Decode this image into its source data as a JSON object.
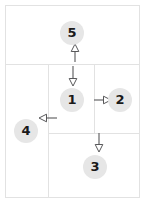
{
  "diagram": {
    "type": "region-flow-diagram",
    "canvas": {
      "width": 145,
      "height": 203
    },
    "colors": {
      "background": "#ffffff",
      "border": "#e2e2e2",
      "node_fill": "#e6e6e6",
      "node_text": "#1a1a1a",
      "arrow": "#58585a",
      "arrow_head_fill": "#ffffff"
    },
    "frame": {
      "x": 5,
      "y": 5,
      "width": 135,
      "height": 193
    },
    "regions": [
      {
        "id": "region-top",
        "label": "5",
        "x": 5,
        "y": 5,
        "width": 135,
        "height": 60
      },
      {
        "id": "region-left",
        "label": "4",
        "x": 5,
        "y": 64,
        "width": 44,
        "height": 134
      },
      {
        "id": "region-center",
        "label": "1",
        "x": 48,
        "y": 64,
        "width": 47,
        "height": 70
      },
      {
        "id": "region-right",
        "label": "2",
        "x": 94,
        "y": 64,
        "width": 46,
        "height": 70
      },
      {
        "id": "region-bottom",
        "label": "3",
        "x": 48,
        "y": 133,
        "width": 92,
        "height": 65
      }
    ],
    "nodes": [
      {
        "id": "node-5",
        "label": "5",
        "x": 72,
        "y": 33,
        "region": "region-top"
      },
      {
        "id": "node-1",
        "label": "1",
        "x": 72,
        "y": 100,
        "region": "region-center"
      },
      {
        "id": "node-2",
        "label": "2",
        "x": 120,
        "y": 100,
        "region": "region-right"
      },
      {
        "id": "node-4",
        "label": "4",
        "x": 26,
        "y": 131,
        "region": "region-left"
      },
      {
        "id": "node-3",
        "label": "3",
        "x": 95,
        "y": 167,
        "region": "region-bottom"
      }
    ],
    "arrows": [
      {
        "id": "arrow-up-to-5",
        "from": "node-1",
        "to": "node-5",
        "direction": "up",
        "x1": 75,
        "y1": 62,
        "x2": 75,
        "y2": 47
      },
      {
        "id": "arrow-down-to-1",
        "from": "node-5",
        "to": "node-1",
        "direction": "down",
        "x1": 73,
        "y1": 67,
        "x2": 73,
        "y2": 84
      },
      {
        "id": "arrow-right-to-2",
        "from": "node-1",
        "to": "node-2",
        "direction": "right",
        "x1": 94,
        "y1": 100,
        "x2": 108,
        "y2": 100
      },
      {
        "id": "arrow-left-to-4",
        "from": "node-1",
        "to": "node-4",
        "direction": "left",
        "x1": 56,
        "y1": 118,
        "x2": 40,
        "y2": 118
      },
      {
        "id": "arrow-down-to-3",
        "from": "node-2",
        "to": "node-3",
        "direction": "down",
        "x1": 99,
        "y1": 133,
        "x2": 99,
        "y2": 150
      }
    ]
  }
}
